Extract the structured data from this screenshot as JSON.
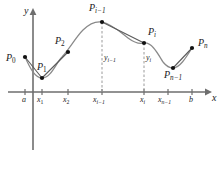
{
  "figure": {
    "kind": "calculus-arc-length-polygonal-approximation",
    "axes": {
      "x_label": "x",
      "y_label": "y",
      "x_axis_color": "#6e6e6e",
      "y_axis_color": "#6e6e6e"
    },
    "curve": {
      "color": "#7a7a7a",
      "description": "smooth curve y = f(x) from a to b"
    },
    "chord_color": "#5a5a5a",
    "dash_color": "#9a9a9a",
    "point_color": "#111111",
    "points": [
      {
        "id": "P0",
        "label_main": "P",
        "label_sub": "0",
        "sub_style": "roman",
        "cx": 25,
        "cy": 57,
        "lx": 6,
        "ly": 59
      },
      {
        "id": "P1",
        "label_main": "P",
        "label_sub": "1",
        "sub_style": "roman",
        "cx": 42,
        "cy": 78,
        "lx": 37,
        "ly": 66
      },
      {
        "id": "P2",
        "label_main": "P",
        "label_sub": "2",
        "sub_style": "roman",
        "cx": 68,
        "cy": 52,
        "lx": 55,
        "ly": 40
      },
      {
        "id": "Pi-1",
        "label_main": "P",
        "label_sub": "i−1",
        "sub_style": "italic",
        "cx": 102,
        "cy": 22,
        "lx": 90,
        "ly": 6
      },
      {
        "id": "Pi",
        "label_main": "P",
        "label_sub": "i",
        "sub_style": "italic",
        "cx": 144,
        "cy": 43,
        "lx": 148,
        "ly": 31
      },
      {
        "id": "Pn-1",
        "label_main": "P",
        "label_sub": "n−1",
        "sub_style": "italic",
        "cx": 173,
        "cy": 68,
        "lx": 165,
        "ly": 72
      },
      {
        "id": "Pn",
        "label_main": "P",
        "label_sub": "n",
        "sub_style": "italic",
        "cx": 192,
        "cy": 48,
        "lx": 197,
        "ly": 41
      }
    ],
    "x_ticks": [
      {
        "id": "a",
        "label_main": "a",
        "label_sub": "",
        "sub_style": "roman",
        "x": 25,
        "ly": 97
      },
      {
        "id": "x1",
        "label_main": "x",
        "label_sub": "1",
        "sub_style": "roman",
        "x": 42,
        "ly": 97
      },
      {
        "id": "x2",
        "label_main": "x",
        "label_sub": "2",
        "sub_style": "roman",
        "x": 68,
        "ly": 97
      },
      {
        "id": "xi-1",
        "label_main": "x",
        "label_sub": "i−1",
        "sub_style": "italic",
        "x": 102,
        "ly": 97
      },
      {
        "id": "xi",
        "label_main": "x",
        "label_sub": "i",
        "sub_style": "italic",
        "x": 144,
        "ly": 97
      },
      {
        "id": "xn-1",
        "label_main": "x",
        "label_sub": "n−1",
        "sub_style": "italic",
        "x": 168,
        "ly": 97
      },
      {
        "id": "b",
        "label_main": "b",
        "label_sub": "",
        "sub_style": "roman",
        "x": 192,
        "ly": 97
      }
    ],
    "ordinate_labels": [
      {
        "id": "yi-1",
        "label_main": "y",
        "label_sub": "i−1",
        "sub_style": "italic",
        "lx": 104,
        "ly": 57
      },
      {
        "id": "yi",
        "label_main": "y",
        "label_sub": "i",
        "sub_style": "italic",
        "lx": 146,
        "ly": 57
      }
    ],
    "dashed_verticals": [
      {
        "id": "dash-xi-1",
        "x": 102,
        "y_top": 22,
        "y_bottom": 92
      },
      {
        "id": "dash-xi",
        "x": 144,
        "y_top": 43,
        "y_bottom": 92
      }
    ],
    "chords": [
      {
        "id": "chord-P0-P1",
        "x1": 25,
        "y1": 57,
        "x2": 42,
        "y2": 78
      },
      {
        "id": "chord-P1-P2",
        "x1": 42,
        "y1": 78,
        "x2": 68,
        "y2": 52
      },
      {
        "id": "chord-Pi-1-Pi",
        "x1": 102,
        "y1": 22,
        "x2": 144,
        "y2": 43
      },
      {
        "id": "chord-Pn-1-Pn",
        "x1": 173,
        "y1": 68,
        "x2": 192,
        "y2": 48
      }
    ],
    "axis_geometry": {
      "x_axis_y": 92,
      "x_axis_x1": 8,
      "x_axis_x2": 210,
      "y_axis_x": 33,
      "y_axis_y1": 10,
      "y_axis_y2": 150,
      "tick_half_height": 3
    }
  }
}
